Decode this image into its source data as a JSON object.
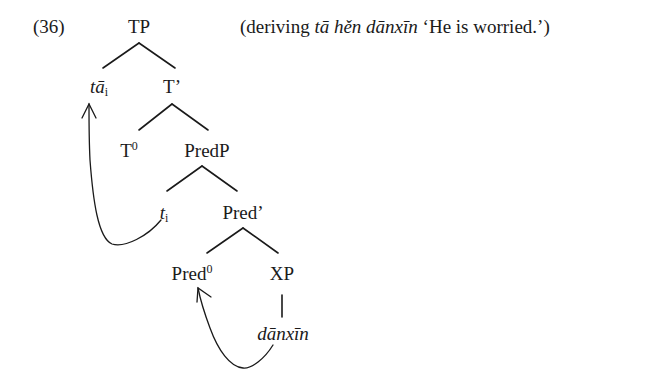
{
  "example_number": "(36)",
  "caption": {
    "open": "(deriving ",
    "italic": "tā hěn dānxīn",
    "gloss": " ‘He is worried.’)"
  },
  "tree": {
    "nodes": {
      "tp": {
        "label": "TP"
      },
      "ta": {
        "label": "tā",
        "index": "i"
      },
      "t_bar": {
        "label": "T’"
      },
      "t0": {
        "label": "T",
        "sup": "0"
      },
      "predp": {
        "label": "PredP"
      },
      "trace": {
        "label": "t",
        "index": "i"
      },
      "pred_bar": {
        "label": "Pred’"
      },
      "pred0": {
        "label": "Pred",
        "sup": "0"
      },
      "xp": {
        "label": "XP"
      },
      "danxin": {
        "label": "dānxīn"
      }
    },
    "movements": [
      {
        "from": "trace",
        "to": "ta"
      },
      {
        "from": "danxin",
        "to": "pred0"
      }
    ]
  },
  "colors": {
    "ink": "#1a1a1a",
    "background": "#ffffff"
  }
}
